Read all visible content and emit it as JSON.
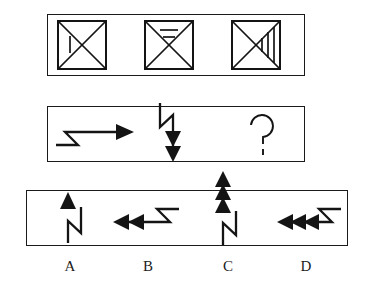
{
  "puzzle": {
    "type": "non-verbal-reasoning-sequence",
    "stroke_color": "#141414",
    "background_color": "#ffffff",
    "top_panel": {
      "name": "analogy-figures-row",
      "figures": [
        {
          "id": "figure-1",
          "shape": "square-with-both-diagonals",
          "marks": 1,
          "mark_orientation": "vertical",
          "mark_region": "left-triangle"
        },
        {
          "id": "figure-2",
          "shape": "square-with-both-diagonals",
          "marks": 2,
          "mark_orientation": "horizontal",
          "mark_region": "top-triangle"
        },
        {
          "id": "figure-3",
          "shape": "square-with-both-diagonals",
          "marks": 3,
          "mark_orientation": "vertical",
          "mark_region": "right-triangle"
        }
      ]
    },
    "middle_panel": {
      "name": "question-sequence-row",
      "items": [
        {
          "id": "sequence-item-1",
          "shape": "zigzag-arrow",
          "direction": "right",
          "arrowheads": 1
        },
        {
          "id": "sequence-item-2",
          "shape": "zigzag-arrow",
          "direction": "down",
          "arrowheads": 2
        },
        {
          "id": "sequence-item-3",
          "shape": "question-mark",
          "glyph": "?"
        }
      ]
    },
    "options_panel": {
      "name": "answer-options-row",
      "options": [
        {
          "id": "option-a",
          "label": "A",
          "shape": "zigzag-arrow",
          "direction": "up",
          "arrowheads": 1
        },
        {
          "id": "option-b",
          "label": "B",
          "shape": "zigzag-arrow",
          "direction": "left",
          "arrowheads": 2
        },
        {
          "id": "option-c",
          "label": "C",
          "shape": "zigzag-arrow",
          "direction": "up",
          "arrowheads": 3
        },
        {
          "id": "option-d",
          "label": "D",
          "shape": "zigzag-arrow",
          "direction": "left",
          "arrowheads": 3
        }
      ]
    }
  }
}
